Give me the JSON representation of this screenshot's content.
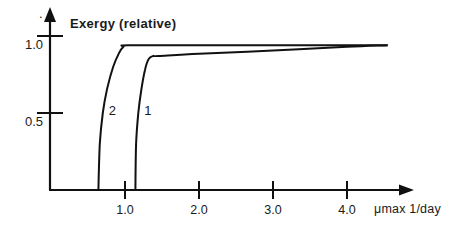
{
  "chart_data": {
    "type": "line",
    "title": "",
    "ylabel": "Exergy (relative)",
    "xlabel": "μmax 1/day",
    "xlim": [
      0,
      4.85
    ],
    "ylim": [
      0,
      1.2
    ],
    "x_ticks": [
      1.0,
      2.0,
      3.0,
      4.0
    ],
    "x_tick_labels": [
      "1.0",
      "2.0",
      "3.0",
      "4.0"
    ],
    "y_ticks": [
      0.5,
      1.0
    ],
    "y_tick_labels": [
      "0.5",
      "1.0"
    ],
    "grid": false,
    "legend": "inline curve labels",
    "series": [
      {
        "name": "2",
        "x": [
          0.64,
          0.66,
          0.7,
          0.76,
          0.84,
          0.92,
          0.98,
          1.04,
          2.0,
          3.0,
          4.0,
          4.55
        ],
        "y": [
          0.0,
          0.3,
          0.5,
          0.66,
          0.8,
          0.89,
          0.93,
          0.94,
          0.94,
          0.94,
          0.94,
          0.94
        ]
      },
      {
        "name": "1",
        "x": [
          1.14,
          1.15,
          1.18,
          1.22,
          1.27,
          1.32,
          1.38,
          1.45,
          2.0,
          3.0,
          4.0,
          4.55
        ],
        "y": [
          0.0,
          0.3,
          0.5,
          0.65,
          0.78,
          0.85,
          0.87,
          0.87,
          0.885,
          0.905,
          0.93,
          0.94
        ]
      }
    ],
    "annotations": [
      {
        "text": "2",
        "x": 0.83,
        "y": 0.52
      },
      {
        "text": "1",
        "x": 1.31,
        "y": 0.52
      }
    ]
  },
  "axes": {
    "y_label": "Exergy (relative)",
    "x_label": "μmax 1/day",
    "dot_mark": "."
  }
}
